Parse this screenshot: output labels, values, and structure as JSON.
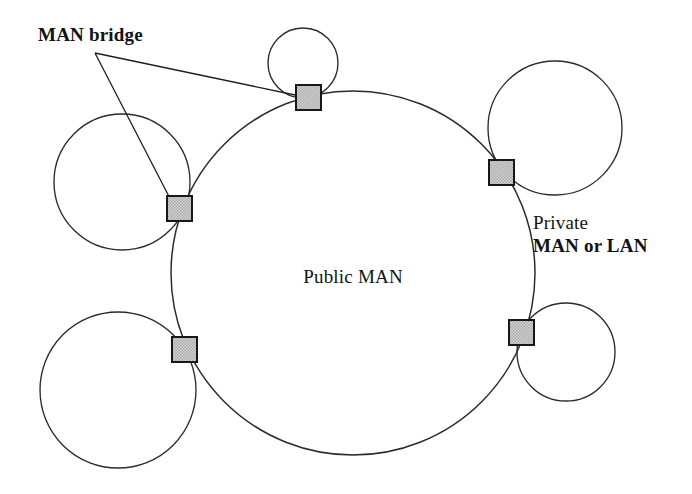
{
  "figure": {
    "type": "network-topology-diagram",
    "background_color": "#ffffff",
    "line_color": "#2b2b2b",
    "bridge_fill_color": "#c9c9c9",
    "bridge_stroke_color": "#171717"
  },
  "labels": {
    "bridge_label": "MAN bridge",
    "center_label": "Public MAN",
    "private_line1": "Private",
    "private_line2": "MAN or LAN"
  },
  "public_man": {
    "name": "Public MAN",
    "cx": 353,
    "cy": 273,
    "r": 182
  },
  "private_networks": [
    {
      "name": "top-private-network",
      "cx": 303,
      "cy": 63,
      "r": 35
    },
    {
      "name": "left-private-network",
      "cx": 122,
      "cy": 182,
      "r": 68
    },
    {
      "name": "lower-left-private-network",
      "cx": 118,
      "cy": 390,
      "r": 78
    },
    {
      "name": "upper-right-private-network",
      "cx": 555,
      "cy": 128,
      "r": 67
    },
    {
      "name": "lower-right-private-network",
      "cx": 566,
      "cy": 352,
      "r": 49
    }
  ],
  "bridges": [
    {
      "name": "bridge-top",
      "x": 296,
      "y": 85,
      "size": 25
    },
    {
      "name": "bridge-left",
      "x": 167,
      "y": 196,
      "size": 25
    },
    {
      "name": "bridge-lower-left",
      "x": 172,
      "y": 337,
      "size": 25
    },
    {
      "name": "bridge-upper-right",
      "x": 489,
      "y": 160,
      "size": 25
    },
    {
      "name": "bridge-lower-right",
      "x": 509,
      "y": 320,
      "size": 25
    }
  ],
  "leader_lines": [
    {
      "name": "leader-to-top-bridge",
      "from_x": 95,
      "from_y": 53,
      "to_x": 300,
      "to_y": 96
    },
    {
      "name": "leader-to-left-bridge",
      "from_x": 95,
      "from_y": 53,
      "to_x": 178,
      "to_y": 214
    }
  ],
  "label_positions": {
    "bridge_label": {
      "x": 38,
      "y": 41
    },
    "center_label": {
      "x": 353,
      "y": 283
    },
    "private_line1": {
      "x": 533,
      "y": 229
    },
    "private_line2": {
      "x": 533,
      "y": 252
    }
  }
}
